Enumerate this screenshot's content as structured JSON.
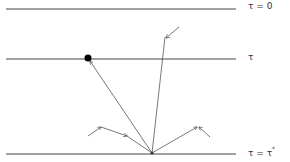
{
  "diagram": {
    "type": "radiative-transfer-layers",
    "colors": {
      "line": "#444444",
      "text": "#333333",
      "point": "#000000"
    },
    "levels": [
      {
        "id": "top",
        "label": "τ = 0",
        "y": 9
      },
      {
        "id": "middle",
        "label": "τ",
        "y": 59
      },
      {
        "id": "bottom",
        "label_main": "τ = τ",
        "label_sup": "*",
        "y": 154
      }
    ],
    "point": {
      "x": 88,
      "y": 58
    },
    "ground_point": {
      "x": 152,
      "y": 153
    }
  }
}
